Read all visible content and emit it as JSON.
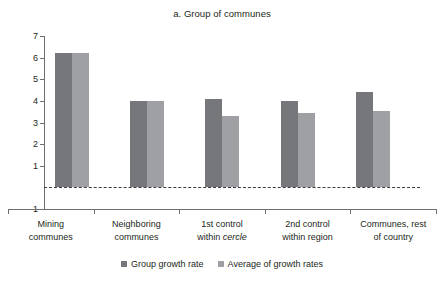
{
  "chart_data": {
    "type": "bar",
    "title": "a. Group of communes",
    "xlabel": "",
    "ylabel": "",
    "ylim": [
      -1,
      7
    ],
    "yticks": [
      7,
      6,
      5,
      4,
      3,
      2,
      1,
      -1
    ],
    "ytick_labels": [
      "7",
      "6",
      "5",
      "4",
      "3",
      "2",
      "1",
      "-1"
    ],
    "grid": false,
    "legend_position": "bottom",
    "zero_reference_line": 0,
    "categories": [
      "Mining communes",
      "Neighboring communes",
      "1st control within cercle",
      "2nd control within region",
      "Communes, rest of country"
    ],
    "category_lines": [
      [
        "Mining",
        "communes"
      ],
      [
        "Neighboring",
        "communes"
      ],
      [
        "1st control",
        "within cercle"
      ],
      [
        "2nd control",
        "within region"
      ],
      [
        "Communes, rest",
        "of country"
      ]
    ],
    "series": [
      {
        "name": "Group growth rate",
        "color": "#76777a",
        "values": [
          6.2,
          4.0,
          4.1,
          4.0,
          4.4
        ]
      },
      {
        "name": "Average of growth rates",
        "color": "#9fa0a3",
        "values": [
          6.2,
          4.0,
          3.3,
          3.45,
          3.55
        ]
      }
    ]
  }
}
